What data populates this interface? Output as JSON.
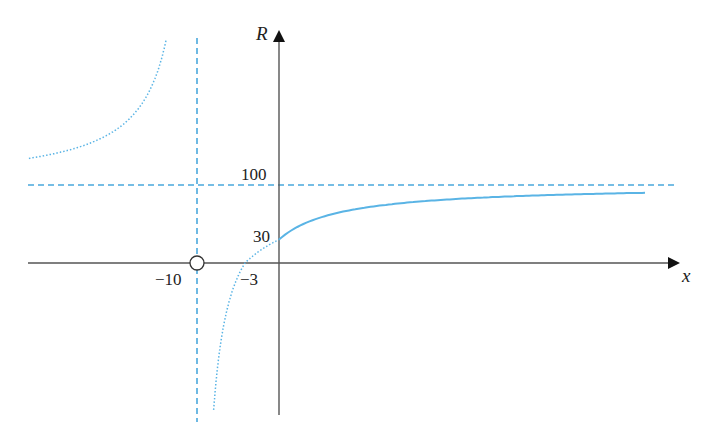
{
  "chart_data": {
    "type": "line",
    "title": "",
    "xlabel": "x",
    "ylabel": "R",
    "function": "R = 100(x + 3)/(x + 10)",
    "grid": false,
    "legend": null,
    "series": [
      {
        "name": "R(x) for x >= 0 (solid)",
        "style": "solid",
        "x": [
          0,
          5,
          10,
          20,
          30,
          40,
          50,
          60
        ],
        "values": [
          30,
          53.3,
          65,
          76.7,
          82.5,
          86,
          88.3,
          90
        ]
      },
      {
        "name": "R(x) for -10 < x < 0 (dotted)",
        "style": "dotted",
        "x": [
          -9.7,
          -9,
          -8,
          -6,
          -3,
          0
        ],
        "values": [
          -2233,
          -600,
          -250,
          -75,
          0,
          30
        ]
      },
      {
        "name": "R(x) for x < -10 (dotted)",
        "style": "dotted",
        "x": [
          -30,
          -20,
          -15,
          -12,
          -11,
          -10.5
        ],
        "values": [
          135,
          170,
          240,
          450,
          800,
          1500
        ]
      }
    ],
    "asymptotes": [
      {
        "type": "horizontal",
        "value": 100,
        "style": "dashed"
      },
      {
        "type": "vertical",
        "value": -10,
        "style": "dashed"
      }
    ],
    "annotations": [
      {
        "text": "100",
        "at": "y=100 on R-axis"
      },
      {
        "text": "30",
        "at": "y-intercept (0, 30)"
      },
      {
        "text": "−3",
        "at": "x-intercept (−3, 0)"
      },
      {
        "text": "−10",
        "at": "x = −10, open circle on x-axis"
      }
    ],
    "open_point": {
      "x": -10,
      "y": 0
    },
    "colors": {
      "curve": "#5ab4e5",
      "axes": "#555555",
      "asymptote": "#4aa8dc"
    }
  },
  "labels": {
    "y_axis": "R",
    "x_axis": "x",
    "y100": "100",
    "y30": "30",
    "xneg3": "−3",
    "xneg10": "−10"
  }
}
